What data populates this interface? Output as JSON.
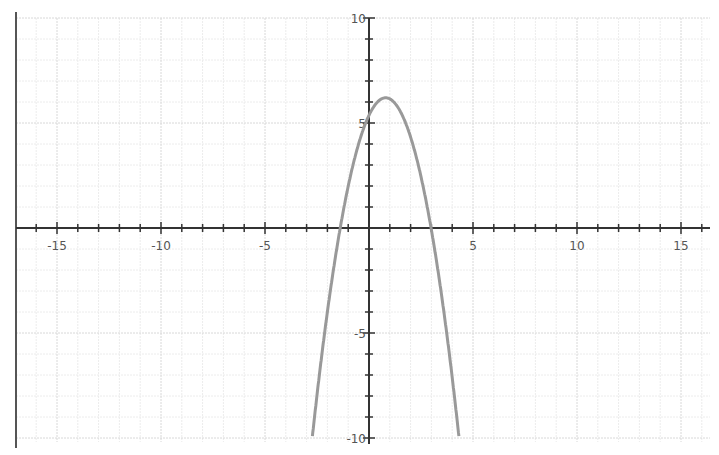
{
  "chart_data": {
    "type": "line",
    "title": "",
    "xlabel": "",
    "ylabel": "",
    "xlim": [
      -16.8,
      16.2
    ],
    "ylim": [
      -10.2,
      10.8
    ],
    "grid": true,
    "legend": null,
    "x_tick_labels": [
      "-15",
      "-10",
      "-5",
      "5",
      "10",
      "15"
    ],
    "y_tick_labels": [
      "10",
      "5",
      "-5",
      "-10"
    ],
    "x_ticks": [
      -15,
      -10,
      -5,
      5,
      10,
      15
    ],
    "y_ticks": [
      10,
      5,
      -5,
      -10
    ],
    "series": [
      {
        "name": "parabola",
        "equation": "y = -1.3(x - 0.8)^2 + 6.2",
        "color": "#999999",
        "vertex": [
          0.8,
          6.2
        ],
        "y_intercept": 5,
        "x_intercepts": [
          -1.35,
          2.95
        ],
        "x": [
          -2.75,
          -2,
          -1.35,
          -1,
          0,
          0.8,
          1.5,
          2,
          2.95,
          3.5,
          4.3
        ],
        "y": [
          -10,
          -5.1,
          0,
          1.9,
          5.0,
          6.2,
          5.6,
          4.3,
          0,
          -3.6,
          -10
        ]
      }
    ]
  },
  "colors": {
    "background": "#ffffff",
    "major_grid": "#d8d8d8",
    "minor_grid": "#ececec",
    "axis": "#333333",
    "curve": "#999999",
    "border": "#555555"
  }
}
